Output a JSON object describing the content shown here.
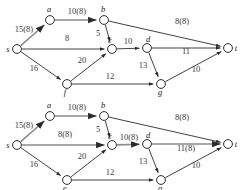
{
  "figure": {
    "diagram_count": 2
  },
  "diagrams": [
    {
      "id": "top",
      "caption": "",
      "nodes": [
        {
          "id": "s",
          "label": "s",
          "x": 17,
          "y": 49,
          "label_dx": -9,
          "label_dy": 3
        },
        {
          "id": "a",
          "label": "a",
          "x": 50,
          "y": 20,
          "label_dx": -1,
          "label_dy": -8
        },
        {
          "id": "b",
          "label": "b",
          "x": 104,
          "y": 20,
          "label_dx": -1,
          "label_dy": -8
        },
        {
          "id": "c",
          "label": "c",
          "x": 112,
          "y": 49,
          "label_dx": -2,
          "label_dy": -6
        },
        {
          "id": "d",
          "label": "d",
          "x": 147,
          "y": 48,
          "label_dx": 1,
          "label_dy": -6
        },
        {
          "id": "f",
          "label": "f",
          "x": 67,
          "y": 84,
          "label_dx": -2,
          "label_dy": 11
        },
        {
          "id": "g",
          "label": "g",
          "x": 161,
          "y": 84,
          "label_dx": -1,
          "label_dy": 11
        },
        {
          "id": "t",
          "label": "t",
          "x": 228,
          "y": 48,
          "label_dx": 8,
          "label_dy": 3
        }
      ],
      "edges": [
        {
          "from": "s",
          "to": "a",
          "label": "15(8)",
          "lx": 24,
          "ly": 32,
          "highlight": true
        },
        {
          "from": "a",
          "to": "b",
          "label": "10(8)",
          "lx": 77,
          "ly": 14,
          "highlight": true
        },
        {
          "from": "b",
          "to": "c",
          "label": "5",
          "lx": 98,
          "ly": 36,
          "highlight": false
        },
        {
          "from": "b",
          "to": "t",
          "label": "8(8)",
          "lx": 182,
          "ly": 24,
          "highlight": false
        },
        {
          "from": "s",
          "to": "c",
          "label": "8",
          "lx": 67,
          "ly": 41,
          "highlight": false
        },
        {
          "from": "c",
          "to": "d",
          "label": "10",
          "lx": 128,
          "ly": 44,
          "highlight": false
        },
        {
          "from": "d",
          "to": "t",
          "label": "11",
          "lx": 186,
          "ly": 54,
          "highlight": false
        },
        {
          "from": "s",
          "to": "f",
          "label": "16",
          "lx": 34,
          "ly": 71,
          "highlight": false
        },
        {
          "from": "f",
          "to": "c",
          "label": "20",
          "lx": 82,
          "ly": 63,
          "highlight": false
        },
        {
          "from": "f",
          "to": "g",
          "label": "12",
          "lx": 110,
          "ly": 79,
          "highlight": false
        },
        {
          "from": "d",
          "to": "g",
          "label": "13",
          "lx": 143,
          "ly": 68,
          "highlight": false
        },
        {
          "from": "g",
          "to": "t",
          "label": "10",
          "lx": 196,
          "ly": 72,
          "highlight": false
        }
      ]
    },
    {
      "id": "bottom",
      "caption": "",
      "nodes": [
        {
          "id": "s",
          "label": "s",
          "x": 17,
          "y": 145,
          "label_dx": -9,
          "label_dy": 3
        },
        {
          "id": "a",
          "label": "a",
          "x": 50,
          "y": 116,
          "label_dx": -1,
          "label_dy": -8
        },
        {
          "id": "b",
          "label": "b",
          "x": 104,
          "y": 116,
          "label_dx": -1,
          "label_dy": -8
        },
        {
          "id": "c",
          "label": "c",
          "x": 112,
          "y": 145,
          "label_dx": -2,
          "label_dy": -6
        },
        {
          "id": "d",
          "label": "d",
          "x": 147,
          "y": 144,
          "label_dx": 1,
          "label_dy": -6
        },
        {
          "id": "e",
          "label": "e",
          "x": 67,
          "y": 180,
          "label_dx": -2,
          "label_dy": 11
        },
        {
          "id": "g",
          "label": "g",
          "x": 161,
          "y": 180,
          "label_dx": -1,
          "label_dy": 11
        },
        {
          "id": "t",
          "label": "t",
          "x": 228,
          "y": 144,
          "label_dx": 8,
          "label_dy": 3
        }
      ],
      "edges": [
        {
          "from": "s",
          "to": "a",
          "label": "15(8)",
          "lx": 24,
          "ly": 128,
          "highlight": true
        },
        {
          "from": "a",
          "to": "b",
          "label": "10(8)",
          "lx": 77,
          "ly": 110,
          "highlight": true
        },
        {
          "from": "b",
          "to": "c",
          "label": "5",
          "lx": 98,
          "ly": 132,
          "highlight": false
        },
        {
          "from": "b",
          "to": "t",
          "label": "8(8)",
          "lx": 182,
          "ly": 120,
          "highlight": false
        },
        {
          "from": "s",
          "to": "c",
          "label": "8(8)",
          "lx": 65,
          "ly": 137,
          "highlight": true
        },
        {
          "from": "c",
          "to": "d",
          "label": "10(8)",
          "lx": 129,
          "ly": 140,
          "highlight": true
        },
        {
          "from": "d",
          "to": "t",
          "label": "11(8)",
          "lx": 186,
          "ly": 151,
          "highlight": true
        },
        {
          "from": "s",
          "to": "e",
          "label": "16",
          "lx": 34,
          "ly": 167,
          "highlight": false
        },
        {
          "from": "e",
          "to": "c",
          "label": "20",
          "lx": 82,
          "ly": 159,
          "highlight": false
        },
        {
          "from": "e",
          "to": "g",
          "label": "12",
          "lx": 110,
          "ly": 175,
          "highlight": false
        },
        {
          "from": "d",
          "to": "g",
          "label": "13",
          "lx": 143,
          "ly": 164,
          "highlight": false
        },
        {
          "from": "g",
          "to": "t",
          "label": "10",
          "lx": 196,
          "ly": 168,
          "highlight": false
        }
      ]
    }
  ],
  "style": {
    "node_radius": 4.4,
    "stroke_color": "#2b2b2b",
    "highlight_color": "#8a8a8a",
    "label_color": "#3a3a3a",
    "background": "#ffffff"
  }
}
